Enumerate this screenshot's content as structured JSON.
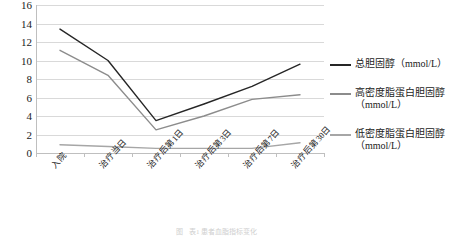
{
  "chart_data": {
    "type": "line",
    "title": "",
    "xlabel": "",
    "ylabel": "",
    "ylim": [
      0,
      16
    ],
    "ytick_step": 2,
    "yticks": [
      "16",
      "14",
      "12",
      "10",
      "8",
      "6",
      "4",
      "2",
      "0"
    ],
    "grid": true,
    "legend_position": "right",
    "categories": [
      "入院",
      "治疗当日",
      "治疗后第1日",
      "治疗后第3日",
      "治疗后第7日",
      "治疗后第30日"
    ],
    "series": [
      {
        "name": "总胆固醇（mmol/L）",
        "label_main": "总胆固醇（mmol/L）",
        "label_unit": "",
        "color": "#262626",
        "values": [
          13.4,
          10.0,
          3.5,
          5.3,
          7.2,
          9.6
        ]
      },
      {
        "name": "高密度脂蛋白胆固醇（mmol/L）",
        "label_main": "高密度脂蛋白胆固醇",
        "label_unit": "（mmol/L）",
        "color": "#8c8c8c",
        "values": [
          11.1,
          8.4,
          2.5,
          4.0,
          5.8,
          6.3
        ]
      },
      {
        "name": "低密度脂蛋白胆固醇（mmol/L）",
        "label_main": "低密度脂蛋白胆固醇",
        "label_unit": "（mmol/L）",
        "color": "#a6a6a6",
        "values": [
          0.9,
          0.7,
          0.5,
          0.5,
          0.5,
          1.1
        ]
      }
    ]
  },
  "caption": {
    "mark": "图",
    "text": "表1 患者血脂指标变化"
  }
}
